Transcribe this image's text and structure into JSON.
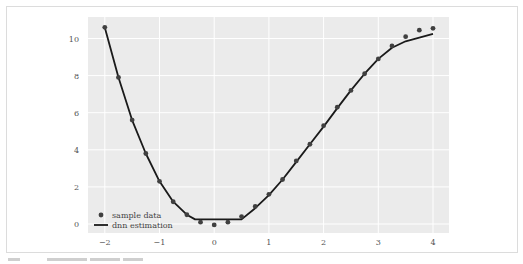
{
  "chart_data": {
    "type": "line",
    "title": "",
    "xlabel": "",
    "ylabel": "",
    "xlim": [
      -2.2,
      4.3
    ],
    "ylim": [
      -0.6,
      11.4
    ],
    "grid": true,
    "legend_position": "lower left",
    "x_ticks": [
      "−2",
      "−1",
      "0",
      "1",
      "2",
      "3",
      "4"
    ],
    "x_tick_values": [
      -2,
      -1,
      0,
      1,
      2,
      3,
      4
    ],
    "y_ticks": [
      "0",
      "2",
      "4",
      "6",
      "8",
      "10"
    ],
    "y_tick_values": [
      0,
      2,
      4,
      6,
      8,
      10
    ],
    "series": [
      {
        "name": "sample data",
        "style": "scatter",
        "color": "#404040",
        "x": [
          -2,
          -1.75,
          -1.5,
          -1.25,
          -1,
          -0.75,
          -0.5,
          -0.25,
          0,
          0.25,
          0.5,
          0.75,
          1,
          1.25,
          1.5,
          1.75,
          2,
          2.25,
          2.5,
          2.75,
          3,
          3.25,
          3.5,
          3.75,
          4
        ],
        "values": [
          10.6,
          7.9,
          5.6,
          3.8,
          2.3,
          1.2,
          0.5,
          0.1,
          -0.05,
          0.1,
          0.4,
          0.95,
          1.6,
          2.4,
          3.4,
          4.3,
          5.3,
          6.3,
          7.2,
          8.1,
          8.9,
          9.6,
          10.1,
          10.45,
          10.55
        ]
      },
      {
        "name": "dnn estimation",
        "style": "line",
        "color": "#1a1a1a",
        "x": [
          -2,
          -1.75,
          -1.5,
          -1.25,
          -1,
          -0.75,
          -0.5,
          -0.35,
          0,
          0.25,
          0.5,
          0.75,
          1,
          1.25,
          1.5,
          1.75,
          2,
          2.25,
          2.5,
          2.75,
          3,
          3.25,
          3.5,
          3.75,
          4
        ],
        "values": [
          10.6,
          7.9,
          5.6,
          3.8,
          2.3,
          1.2,
          0.5,
          0.25,
          0.25,
          0.25,
          0.25,
          0.85,
          1.55,
          2.4,
          3.35,
          4.3,
          5.25,
          6.25,
          7.2,
          8.1,
          8.9,
          9.5,
          9.85,
          10.05,
          10.25
        ]
      }
    ],
    "legend": [
      "sample data",
      "dnn estimation"
    ],
    "plot_background": "#ebebeb",
    "grid_color": "#ffffff"
  },
  "legend": {
    "scatter_label": "sample data",
    "line_label": "dnn estimation"
  }
}
